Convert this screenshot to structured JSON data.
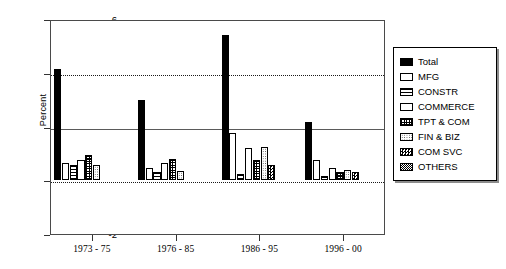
{
  "chart_data": {
    "type": "bar",
    "title": "",
    "xlabel": "",
    "ylabel": "Percent",
    "ylim": [
      -2,
      6
    ],
    "yticks": [
      -2,
      0,
      2,
      4,
      6
    ],
    "grid": "horizontal dotted at 0, 2, 4",
    "legend_position": "right",
    "categories": [
      "1973 - 75",
      "1976 - 85",
      "1986 - 95",
      "1996 - 00"
    ],
    "series": [
      {
        "name": "Total",
        "pattern": "solid-black",
        "values": [
          4.15,
          3.0,
          5.4,
          2.15
        ]
      },
      {
        "name": "MFG",
        "pattern": "light-dots",
        "values": [
          0.65,
          0.45,
          1.75,
          0.75
        ]
      },
      {
        "name": "CONSTR",
        "pattern": "horizontal-lines",
        "values": [
          0.55,
          0.3,
          0.25,
          0.15
        ]
      },
      {
        "name": "COMMERCE",
        "pattern": "dense-dots",
        "values": [
          0.75,
          0.65,
          1.2,
          0.45
        ]
      },
      {
        "name": "TPT & COM",
        "pattern": "grid-crosshatch",
        "values": [
          0.95,
          0.8,
          0.75,
          0.3
        ]
      },
      {
        "name": "FIN & BIZ",
        "pattern": "medium-dots",
        "values": [
          0.55,
          0.35,
          1.25,
          0.4
        ]
      },
      {
        "name": "COM SVC",
        "pattern": "large-checker",
        "values": [
          0.0,
          0.0,
          0.55,
          0.3
        ]
      },
      {
        "name": "OTHERS",
        "pattern": "fine-checker",
        "values": [
          0.0,
          0.0,
          0.0,
          0.0
        ]
      }
    ]
  },
  "axis": {
    "y_title": "Percent",
    "y_tick_labels": [
      "6",
      "4",
      "2",
      "0",
      "-2"
    ],
    "x_tick_labels": [
      "1973 - 75",
      "1976 - 85",
      "1986 - 95",
      "1996 - 00"
    ]
  },
  "legend": {
    "items": [
      {
        "label": "Total"
      },
      {
        "label": "MFG"
      },
      {
        "label": "CONSTR"
      },
      {
        "label": "COMMERCE"
      },
      {
        "label": "TPT & COM"
      },
      {
        "label": "FIN & BIZ"
      },
      {
        "label": "COM SVC"
      },
      {
        "label": "OTHERS"
      }
    ]
  },
  "colors": {
    "frame": "#4a4a4a",
    "bar_outline": "#000000",
    "gridline": "#1a1a1a",
    "background": "#ffffff"
  }
}
